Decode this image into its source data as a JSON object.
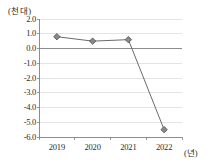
{
  "chart_data": {
    "type": "line",
    "title": "",
    "subtitle": "",
    "xlabel": "(년)",
    "ylabel": "(천 대)",
    "categories": [
      "2019",
      "2020",
      "2021",
      "2022"
    ],
    "series": [
      {
        "name": "",
        "values": [
          0.8,
          0.5,
          0.6,
          -5.5
        ]
      }
    ],
    "ylim": [
      -6.0,
      2.0
    ],
    "yticks": [
      "2.0",
      "1.0",
      "0.0",
      "-1.0",
      "-2.0",
      "-3.0",
      "-4.0",
      "-5.0",
      "-6.0"
    ],
    "ytick_values": [
      2.0,
      1.0,
      0.0,
      -1.0,
      -2.0,
      -3.0,
      -4.0,
      -5.0,
      -6.0
    ],
    "grid": true,
    "legend": "none",
    "marker": "diamond",
    "colors": {
      "line": "#6b6b6b",
      "marker_fill": "#8a8a8a",
      "marker_stroke": "#4a4a4a",
      "grid": "#d9d9d9",
      "axis": "#808080",
      "zero_line": "#808080",
      "text": "#2b2b2b"
    }
  },
  "axis": {
    "y_unit_label": "(천 대)",
    "x_unit_label": "(년)"
  }
}
